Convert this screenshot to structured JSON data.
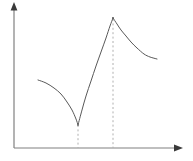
{
  "figure": {
    "title": "",
    "width": 193,
    "height": 161,
    "background_color": "#ffffff",
    "axis_color": "#808080",
    "curve_color": "#595959",
    "dash_color": "#b0b0b0"
  },
  "axes": {
    "y_axis": {
      "name": "y-axis",
      "label": "",
      "x": 14,
      "y_bottom": 148,
      "y_top": 6,
      "arrow_tip_y": 2,
      "has_arrowhead": true,
      "ticks": [],
      "tick_labels": []
    },
    "x_axis": {
      "name": "x-axis",
      "label": "",
      "y": 148,
      "x_left": 14,
      "x_right": 178,
      "arrow_tip_x": 183,
      "has_arrowhead": true,
      "ticks": [],
      "tick_labels": []
    },
    "grid": false,
    "legend": null
  },
  "chart_data": {
    "type": "line",
    "title": "",
    "subtitle": "",
    "xlabel": "",
    "ylabel": "",
    "xlim": [
      0,
      193
    ],
    "ylim": [
      0,
      161
    ],
    "grid": false,
    "legend_position": "none",
    "axis_units": "pixels",
    "series": [
      {
        "name": "branch-1-descending",
        "shape": "concave-down decreasing",
        "points": [
          [
            38,
            80
          ],
          [
            46,
            83
          ],
          [
            54,
            88
          ],
          [
            61,
            94
          ],
          [
            67,
            102
          ],
          [
            72,
            110
          ],
          [
            76,
            119
          ],
          [
            78,
            125
          ]
        ]
      },
      {
        "name": "branch-2-ascending",
        "shape": "concave-down increasing",
        "points": [
          [
            78,
            125
          ],
          [
            82,
            110
          ],
          [
            86,
            96
          ],
          [
            91,
            81
          ],
          [
            96,
            66
          ],
          [
            101,
            52
          ],
          [
            106,
            38
          ],
          [
            110,
            26
          ],
          [
            113,
            18
          ]
        ]
      },
      {
        "name": "branch-3-decaying-tail",
        "shape": "convex decreasing, asymptotic",
        "points": [
          [
            113,
            18
          ],
          [
            117,
            24
          ],
          [
            121,
            30
          ],
          [
            126,
            36
          ],
          [
            131,
            42
          ],
          [
            137,
            48
          ],
          [
            144,
            54
          ],
          [
            150,
            57
          ],
          [
            157,
            59
          ]
        ]
      }
    ],
    "annotations": [
      {
        "name": "cusp-minimum",
        "kind": "critical-point",
        "label": "",
        "x": 78,
        "y": 125,
        "point_type": "cusp (local minimum)"
      },
      {
        "name": "peak-maximum",
        "kind": "critical-point",
        "label": "",
        "x": 113,
        "y": 18,
        "point_type": "corner (local maximum)"
      }
    ],
    "dashed_guides": [
      {
        "name": "dashed-line-at-cusp",
        "orientation": "vertical",
        "x": 78,
        "y_from": 125,
        "y_to": 148
      },
      {
        "name": "dashed-line-at-peak",
        "orientation": "vertical",
        "x": 113,
        "y_from": 19,
        "y_to": 148
      }
    ]
  }
}
